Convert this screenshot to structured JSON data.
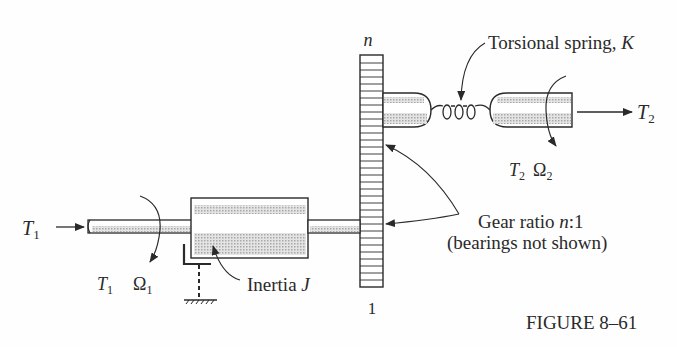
{
  "figure": {
    "caption": "FIGURE 8–61",
    "gear": {
      "top_label": "n",
      "bottom_label": "1"
    },
    "spring_label": "Torsional spring, K",
    "spring_label_plain": "Torsional spring, ",
    "spring_label_var": "K",
    "output": {
      "torque": "T",
      "torque_sub": "2",
      "speed": "Ω",
      "speed_sub": "2"
    },
    "input": {
      "torque": "T",
      "torque_sub": "1",
      "speed": "Ω",
      "speed_sub": "1"
    },
    "inertia_label_plain": "Inertia ",
    "inertia_label_var": "J",
    "gear_ratio_label_plain": "Gear ratio ",
    "gear_ratio_label_var": "n",
    "gear_ratio_label_rest": ":1",
    "bearings_note": "(bearings not shown)"
  },
  "colors": {
    "ink": "#2a2a2a",
    "shade": "#c8c8c8",
    "background": "#fefefe"
  }
}
